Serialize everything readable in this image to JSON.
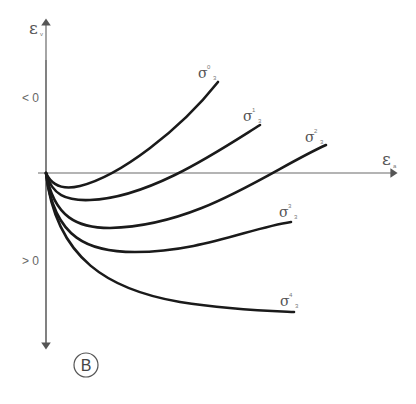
{
  "diagram": {
    "y_axis": {
      "symbol": "ε",
      "subscript": "v",
      "upper_label": "< 0",
      "lower_label": "> 0"
    },
    "x_axis": {
      "symbol": "ε",
      "subscript": "a"
    },
    "panel_label": "B",
    "curves": [
      {
        "name": "σ",
        "sup": "0",
        "sub": "3"
      },
      {
        "name": "σ",
        "sup": "1",
        "sub": "3"
      },
      {
        "name": "σ",
        "sup": "2",
        "sub": "3"
      },
      {
        "name": "σ",
        "sup": "3",
        "sub": "3"
      },
      {
        "name": "σ",
        "sup": "4",
        "sub": "3"
      }
    ],
    "colors": {
      "curve": "#1a1a1a",
      "axis": "#6a6a6a",
      "text": "#555555"
    }
  }
}
